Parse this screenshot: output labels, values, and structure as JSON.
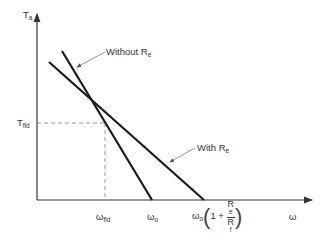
{
  "figure": {
    "y_axis": {
      "symbol": "T",
      "subscript": "a"
    },
    "x_axis": {
      "symbol": "ω"
    },
    "lines": [
      {
        "name": "Without R_e",
        "label_text": "Without R",
        "label_sub": "e"
      },
      {
        "name": "With R_e",
        "label_text": "With R",
        "label_sub": "e"
      }
    ],
    "y_marker": {
      "symbol": "T",
      "subscript": "fld"
    },
    "x_ticks": [
      {
        "symbol": "ω",
        "subscript": "fld"
      },
      {
        "symbol": "ω",
        "subscript": "o"
      },
      {
        "symbol": "ω",
        "subscript": "o",
        "expr_prefix": "1 +",
        "num": "R",
        "num_sub": "e",
        "den": "R",
        "den_sub": "f"
      }
    ],
    "colors": {
      "line": "#1a1a1a",
      "axis": "#333333",
      "dash": "#999999"
    }
  }
}
